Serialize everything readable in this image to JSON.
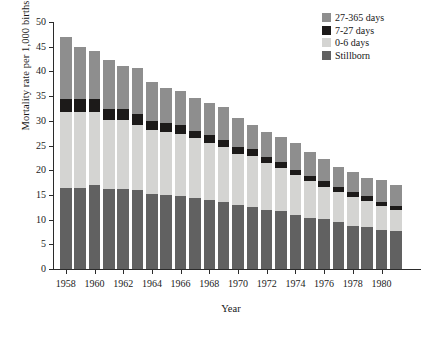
{
  "chart_data": {
    "type": "bar",
    "stacked": true,
    "title": "",
    "xlabel": "Year",
    "ylabel": "Mortality rate per 1,000 births",
    "ylim": [
      0,
      50
    ],
    "yticks": [
      0,
      5,
      10,
      15,
      20,
      25,
      30,
      35,
      40,
      45,
      50
    ],
    "xticks": [
      "1958",
      "1960",
      "1962",
      "1964",
      "1966",
      "1968",
      "1970",
      "1972",
      "1974",
      "1976",
      "1978",
      "1980"
    ],
    "grid": false,
    "legend_position": "top-right",
    "categories": [
      "1958",
      "1959",
      "1960",
      "1961",
      "1962",
      "1963",
      "1964",
      "1965",
      "1966",
      "1967",
      "1968",
      "1969",
      "1970",
      "1971",
      "1972",
      "1973",
      "1974",
      "1975",
      "1976",
      "1977",
      "1978",
      "1979",
      "1980",
      "1981"
    ],
    "series": [
      {
        "name": "Stillborn",
        "color": "#616161",
        "values": [
          16.4,
          16.4,
          17.0,
          16.2,
          16.1,
          16.0,
          15.2,
          14.9,
          14.8,
          14.3,
          13.9,
          13.5,
          13.0,
          12.5,
          12.0,
          11.8,
          10.9,
          10.4,
          10.1,
          9.5,
          8.8,
          8.6,
          7.9,
          7.6
        ]
      },
      {
        "name": "0-6 days",
        "color": "#d4d4d2",
        "values": [
          15.3,
          15.4,
          14.8,
          13.9,
          14.1,
          13.1,
          13.0,
          12.9,
          12.6,
          12.2,
          11.7,
          11.2,
          10.3,
          10.3,
          9.5,
          8.7,
          8.1,
          7.4,
          6.6,
          6.1,
          5.7,
          5.2,
          4.8,
          4.4
        ]
      },
      {
        "name": "7-27 days",
        "color": "#1c1a19",
        "values": [
          2.8,
          2.6,
          2.7,
          2.2,
          2.2,
          2.2,
          1.8,
          1.8,
          1.7,
          1.5,
          1.6,
          1.5,
          1.4,
          1.4,
          1.1,
          1.1,
          1.1,
          1.1,
          1.1,
          1.0,
          1.0,
          0.9,
          0.9,
          0.8
        ]
      },
      {
        "name": "27-365 days",
        "color": "#8e8e8e",
        "values": [
          12.5,
          10.6,
          9.6,
          10.1,
          8.7,
          9.3,
          7.9,
          7.0,
          6.9,
          6.6,
          6.5,
          6.6,
          5.9,
          5.0,
          5.1,
          5.2,
          5.4,
          4.8,
          4.4,
          4.0,
          4.1,
          3.8,
          4.4,
          4.2
        ]
      }
    ],
    "totals": [
      47.0,
      45.0,
      44.1,
      42.4,
      41.1,
      40.6,
      37.9,
      36.6,
      36.0,
      34.6,
      33.7,
      32.8,
      30.6,
      29.2,
      27.7,
      26.8,
      25.5,
      23.7,
      22.2,
      20.6,
      19.6,
      18.5,
      18.0,
      17.0
    ]
  },
  "legend": {
    "items": [
      {
        "label": "27-365 days",
        "swatch": "#8e8e8e"
      },
      {
        "label": "7-27 days",
        "swatch": "#1c1a19"
      },
      {
        "label": "0-6 days",
        "swatch": "#d4d4d2"
      },
      {
        "label": "Stillborn",
        "swatch": "#616161"
      }
    ]
  },
  "axes": {
    "y_title": "Mortality rate per 1,000 births",
    "x_title": "Year"
  },
  "caption": ""
}
